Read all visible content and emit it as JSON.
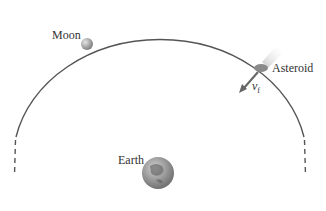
{
  "labels": {
    "moon": "Moon",
    "asteroid": "Asteroid",
    "earth": "Earth",
    "velocity": "v",
    "velocity_sub": "f"
  },
  "colors": {
    "orbit": "#555555",
    "arrow": "#666666",
    "asteroid": "#8a8a8a",
    "earth": "#9a9a9a",
    "moon": "#a0a0a0"
  }
}
